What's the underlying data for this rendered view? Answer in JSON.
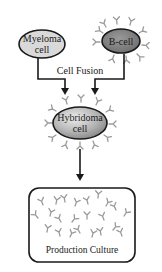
{
  "diagram": {
    "nodes": {
      "myeloma": {
        "line1": "Myeloma",
        "line2": "cell",
        "fill": "#d9d9d9"
      },
      "bcell": {
        "label": "B-cell",
        "fill": "#7a7a7a"
      },
      "hybridoma": {
        "line1": "Hybridoma",
        "line2": "cell",
        "fill_light": "#e6e6e6",
        "fill_dark": "#8c8c8c"
      },
      "culture": {
        "label": "Production Culture"
      }
    },
    "edges": {
      "fusion_label": "Cell Fusion"
    },
    "colors": {
      "stroke": "#1a1a1a",
      "antibody": "#9a9a9a"
    }
  }
}
